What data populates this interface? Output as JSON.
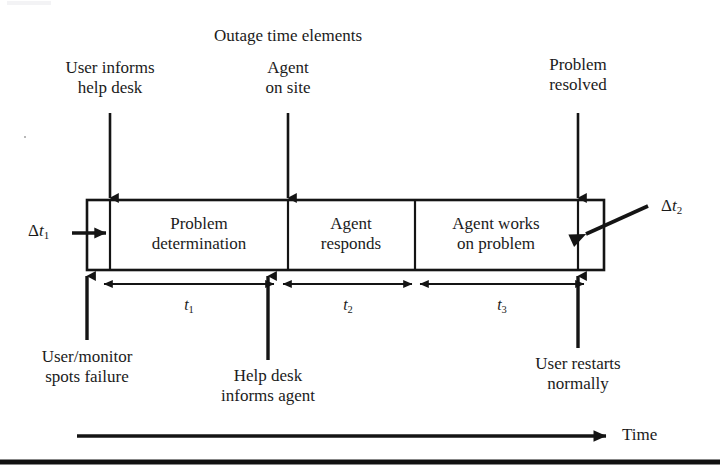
{
  "diagram": {
    "title": "Outage time elements",
    "type": "timeline-block-diagram",
    "axis_label": "Time",
    "segments": [
      {
        "id": "problem-determination",
        "line1": "Problem",
        "line2": "determination"
      },
      {
        "id": "agent-responds",
        "line1": "Agent",
        "line2": "responds"
      },
      {
        "id": "agent-works",
        "line1": "Agent works",
        "line2": "on problem"
      }
    ],
    "delta_labels": [
      {
        "id": "delta-t1",
        "symbol": "Δ",
        "var": "t",
        "sub": "1"
      },
      {
        "id": "delta-t2",
        "symbol": "Δ",
        "var": "t",
        "sub": "2"
      }
    ],
    "duration_labels": [
      {
        "id": "t1",
        "var": "t",
        "sub": "1"
      },
      {
        "id": "t2",
        "var": "t",
        "sub": "2"
      },
      {
        "id": "t3",
        "var": "t",
        "sub": "3"
      }
    ],
    "top_callouts": [
      {
        "id": "user-informs-help-desk",
        "line1": "User informs",
        "line2": "help desk"
      },
      {
        "id": "agent-on-site",
        "line1": "Agent",
        "line2": "on site"
      },
      {
        "id": "problem-resolved",
        "line1": "Problem",
        "line2": "resolved"
      }
    ],
    "bottom_callouts": [
      {
        "id": "user-monitor-spots-failure",
        "line1": "User/monitor",
        "line2": "spots failure"
      },
      {
        "id": "help-desk-informs-agent",
        "line1": "Help desk",
        "line2": "informs agent"
      },
      {
        "id": "user-restarts-normally",
        "line1": "User restarts",
        "line2": "normally"
      }
    ],
    "colors": {
      "ink": "#1b1b1b",
      "background": "#ffffff",
      "rule": "#111111"
    }
  }
}
